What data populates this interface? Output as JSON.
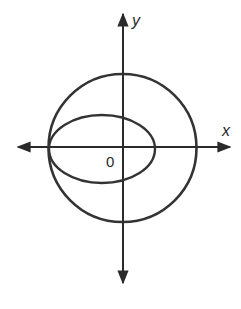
{
  "diagram": {
    "axes": {
      "x_label": "x",
      "y_label": "y",
      "origin_label": "0"
    },
    "shapes": [
      {
        "type": "circle",
        "description": "circle centered at origin"
      },
      {
        "type": "ellipse",
        "description": "ellipse shifted left, tangent to circle at left x-intercept"
      }
    ],
    "colors": {
      "stroke": "#2a2a2a",
      "background": "#ffffff"
    }
  }
}
